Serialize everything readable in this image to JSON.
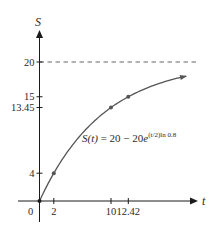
{
  "chart_data": {
    "type": "line",
    "title": "",
    "xlabel": "t",
    "ylabel": "S",
    "equation": "S(t) = 20 − 20e^{(t/2) ln 0.8}",
    "equation_parts": {
      "lhs": "S(t)",
      "eq": " = 20 − 20",
      "e": "e",
      "exponent": "(t/2)ln 0.8"
    },
    "asymptote": {
      "y": 20,
      "style": "dashed"
    },
    "x_ticks": [
      {
        "value": 0,
        "label": "0"
      },
      {
        "value": 2,
        "label": "2"
      },
      {
        "value": 10,
        "label": "10"
      },
      {
        "value": 12.42,
        "label": "12.42"
      }
    ],
    "y_ticks": [
      {
        "value": 4,
        "label": "4"
      },
      {
        "value": 13.45,
        "label": "13.45"
      },
      {
        "value": 15,
        "label": "15"
      },
      {
        "value": 20,
        "label": "20"
      }
    ],
    "points": [
      {
        "t": 0,
        "S": 0
      },
      {
        "t": 2,
        "S": 4
      },
      {
        "t": 10,
        "S": 13.45
      },
      {
        "t": 12.42,
        "S": 15
      }
    ],
    "xlim": [
      0,
      22
    ],
    "ylim": [
      0,
      22
    ],
    "grid": false,
    "legend": null
  },
  "colors": {
    "axis": "#1a1a1a",
    "curve": "#555555",
    "asymptote": "#666666",
    "point": "#555555"
  }
}
